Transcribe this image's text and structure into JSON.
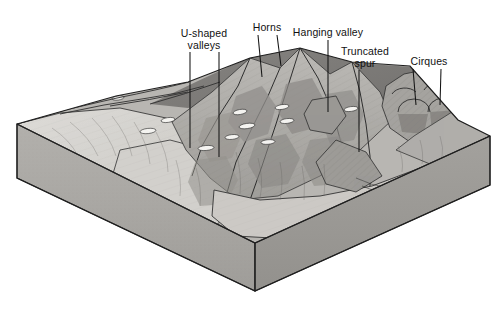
{
  "figure": {
    "type": "geological-block-diagram",
    "palette": {
      "background": "#ffffff",
      "ink": "#111111",
      "leader_line": "#1a1a1a",
      "block_front_face": "#a9a9a9",
      "block_right_face": "#9a9a9a",
      "valley_floor_light": "#d8d6d2",
      "ridge_mid": "#b4b2ae",
      "slope_shadow": "#8e8c89",
      "slope_dark": "#6f6d6b",
      "snow_patch": "#f2f1ee"
    }
  },
  "labels": [
    {
      "id": "u-shaped-valleys",
      "text_line_1": "U-shaped",
      "text_line_2": "valleys",
      "text": "U-shaped valleys",
      "x": 204,
      "y": 28,
      "leaders": [
        {
          "x1": 190,
          "y1": 52,
          "x2": 190,
          "y2": 148
        },
        {
          "x1": 219,
          "y1": 52,
          "x2": 219,
          "y2": 157
        }
      ]
    },
    {
      "id": "horns",
      "text_line_1": "Horns",
      "text_line_2": "",
      "text": "Horns",
      "x": 267,
      "y": 22,
      "leaders": [
        {
          "x1": 258,
          "y1": 35,
          "x2": 262,
          "y2": 77
        },
        {
          "x1": 277,
          "y1": 35,
          "x2": 281,
          "y2": 66
        }
      ]
    },
    {
      "id": "hanging-valley",
      "text_line_1": "Hanging valley",
      "text_line_2": "",
      "text": "Hanging valley",
      "x": 328,
      "y": 27,
      "leaders": [
        {
          "x1": 328,
          "y1": 40,
          "x2": 328,
          "y2": 112
        }
      ]
    },
    {
      "id": "truncated-spur",
      "text_line_1": "Truncated",
      "text_line_2": "spur",
      "text": "Truncated spur",
      "x": 365,
      "y": 46,
      "leaders": [
        {
          "x1": 359,
          "y1": 70,
          "x2": 359,
          "y2": 152
        }
      ]
    },
    {
      "id": "cirques",
      "text_line_1": "Cirques",
      "text_line_2": "",
      "text": "Cirques",
      "x": 429,
      "y": 56,
      "leaders": [
        {
          "x1": 413,
          "y1": 69,
          "x2": 416,
          "y2": 105
        },
        {
          "x1": 441,
          "y1": 69,
          "x2": 440,
          "y2": 105
        }
      ]
    }
  ],
  "block": {
    "corners": {
      "back_left": {
        "x": 17,
        "y": 124
      },
      "front_left_bottom": {
        "x": 17,
        "y": 178
      },
      "front_corner_top": {
        "x": 255,
        "y": 243
      },
      "front_corner_bottom": {
        "x": 255,
        "y": 291
      },
      "right_top": {
        "x": 490,
        "y": 136
      },
      "right_bottom": {
        "x": 490,
        "y": 185
      },
      "back_right": {
        "x": 458,
        "y": 120
      }
    },
    "thickness_px": 52
  }
}
